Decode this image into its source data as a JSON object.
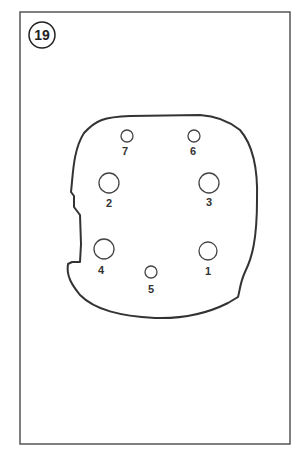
{
  "figure": {
    "number": "19",
    "frame": {
      "x": 20,
      "y": 12,
      "w": 270,
      "h": 432,
      "stroke": "#555555"
    },
    "outline_color": "#333333",
    "holes": [
      {
        "label": "1",
        "cx": 208,
        "cy": 251,
        "r": 9,
        "lx": 208,
        "ly": 275
      },
      {
        "label": "2",
        "cx": 109,
        "cy": 183,
        "r": 10,
        "lx": 109,
        "ly": 207
      },
      {
        "label": "3",
        "cx": 209,
        "cy": 183,
        "r": 10,
        "lx": 209,
        "ly": 206
      },
      {
        "label": "4",
        "cx": 104,
        "cy": 249,
        "r": 10,
        "lx": 101,
        "ly": 274
      },
      {
        "label": "5",
        "cx": 151,
        "cy": 272,
        "r": 6,
        "lx": 151,
        "ly": 293
      },
      {
        "label": "6",
        "cx": 194,
        "cy": 136,
        "r": 6,
        "lx": 193,
        "ly": 155
      },
      {
        "label": "7",
        "cx": 127,
        "cy": 136,
        "r": 6,
        "lx": 125,
        "ly": 155
      }
    ]
  }
}
